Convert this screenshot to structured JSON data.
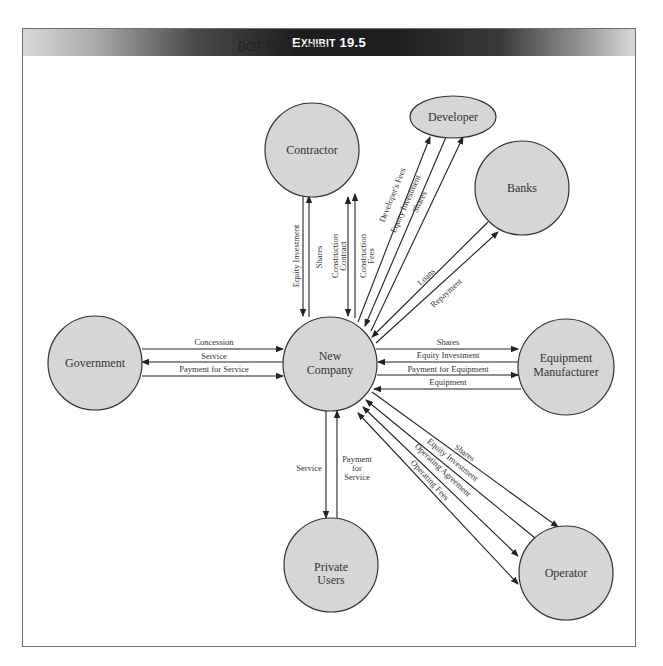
{
  "exhibit": {
    "prefix_big": "E",
    "prefix_small": "XHIBIT",
    "number": "19.5",
    "title": "Exhibit 19.5",
    "subtitle": "BOT Transaction"
  },
  "colors": {
    "node_fill": "#d6d6d6",
    "node_stroke": "#333333",
    "header_dark": "#1e1e1e",
    "frame_border": "#6e6e6e"
  },
  "nodes": {
    "contractor": {
      "label": "Contractor"
    },
    "developer": {
      "label": "Developer"
    },
    "banks": {
      "label": "Banks"
    },
    "government": {
      "label": "Government"
    },
    "new_company": {
      "label_line1": "New",
      "label_line2": "Company"
    },
    "equipment_manufacturer": {
      "label_line1": "Equipment",
      "label_line2": "Manufacturer"
    },
    "private_users": {
      "label_line1": "Private",
      "label_line2": "Users"
    },
    "operator": {
      "label": "Operator"
    }
  },
  "edges": {
    "contractor": {
      "equity_investment": "Equity Investment",
      "shares": "Shares",
      "construction_contract_1": "Construction",
      "construction_contract_2": "Contract",
      "construction_fees_1": "Construction",
      "construction_fees_2": "Fees"
    },
    "developer": {
      "developers_fees": "Developer's Fees",
      "equity_investment": "Equity Investment",
      "shares": "Shares"
    },
    "banks": {
      "loans": "Loans",
      "repayment": "Repayment"
    },
    "government": {
      "concession": "Concession",
      "service": "Service",
      "payment_for_service": "Payment for Service"
    },
    "equipment_manufacturer": {
      "shares": "Shares",
      "equity_investment": "Equity Investment",
      "payment_for_equipment": "Payment for Equipment",
      "equipment": "Equipment"
    },
    "private_users": {
      "service": "Service",
      "payment_1": "Payment",
      "payment_2": "for",
      "payment_3": "Service"
    },
    "operator": {
      "shares": "Shares",
      "equity_investment": "Equity Investment",
      "operating_agreement": "Operating Agreement",
      "operating_fees": "Operating Fees"
    }
  }
}
